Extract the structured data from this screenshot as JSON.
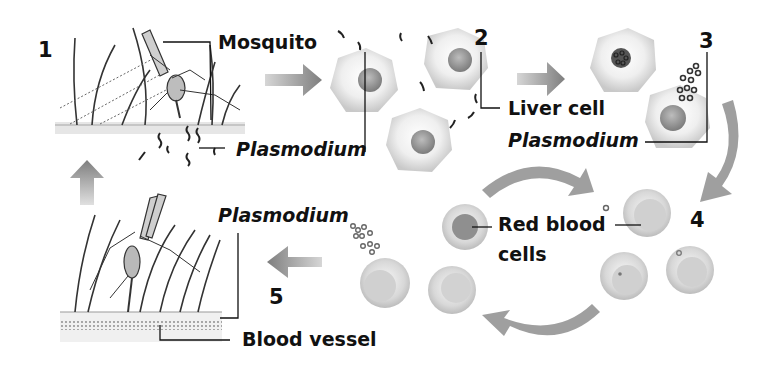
{
  "steps": {
    "s1": "1",
    "s2": "2",
    "s3": "3",
    "s4": "4",
    "s5": "5"
  },
  "labels": {
    "mosquito": "Mosquito",
    "plasmodium_skin": "Plasmodium",
    "liver_cell": "Liver cell",
    "plasmodium_liver": "Plasmodium",
    "red_blood_cells_line1": "Red blood",
    "red_blood_cells_line2": "cells",
    "plasmodium_blood": "Plasmodium",
    "blood_vessel": "Blood vessel"
  },
  "colors": {
    "arrow": "#8a8a8a",
    "cell_fill": "#e4e4e4",
    "nucleus": "#9a9a9a",
    "leader_line": "#111111"
  }
}
